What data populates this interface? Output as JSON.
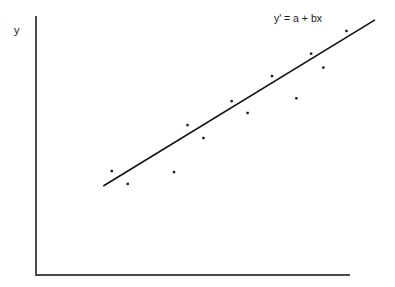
{
  "chart_data": {
    "type": "scatter",
    "title": "",
    "subtitle": "",
    "xlabel": "",
    "ylabel": "y",
    "xlim": [
      0,
      100
    ],
    "ylim": [
      0,
      100
    ],
    "grid": false,
    "legend": null,
    "annotations": [
      {
        "name": "regression-equation",
        "text": "y' = a + bx",
        "x": 89,
        "y": 96
      }
    ],
    "series": [
      {
        "name": "observations",
        "type": "scatter",
        "marker": "square-dot",
        "color": "#1a1a1a",
        "points": [
          {
            "x": 24.2,
            "y": 40.3
          },
          {
            "x": 29.3,
            "y": 35.3
          },
          {
            "x": 44.1,
            "y": 39.9
          },
          {
            "x": 48.4,
            "y": 58.1
          },
          {
            "x": 53.5,
            "y": 53.1
          },
          {
            "x": 62.5,
            "y": 67.4
          },
          {
            "x": 67.6,
            "y": 62.8
          },
          {
            "x": 75.4,
            "y": 77.1
          },
          {
            "x": 83.2,
            "y": 68.5
          },
          {
            "x": 87.9,
            "y": 85.8
          },
          {
            "x": 91.8,
            "y": 80.4
          },
          {
            "x": 99.2,
            "y": 94.6
          }
        ]
      },
      {
        "name": "least-squares-line",
        "type": "line",
        "color": "#111111",
        "x_start": 21.5,
        "y_start": 34.5,
        "x_end": 108.3,
        "y_end": 98.9
      }
    ]
  },
  "axes": {
    "y_axis_label": "y",
    "y_axis_name": "vertical-axis",
    "x_axis_name": "horizontal-axis"
  }
}
